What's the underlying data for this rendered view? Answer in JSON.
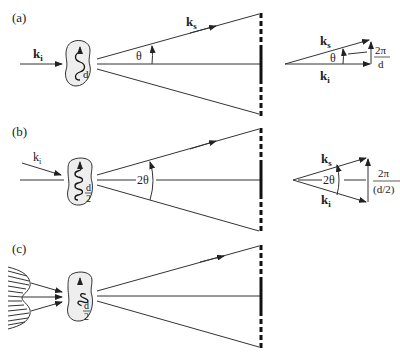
{
  "figure": {
    "panels": [
      {
        "label": "(a)",
        "incident_label": "k",
        "incident_sub": "i",
        "scattered_label": "k",
        "scattered_sub": "s",
        "angle_label": "θ",
        "spacing_label": "d",
        "vector": {
          "ks_label": "k",
          "ks_sub": "s",
          "ki_label": "k",
          "ki_sub": "i",
          "angle_label": "θ",
          "q_num": "2π",
          "q_den": "d"
        }
      },
      {
        "label": "(b)",
        "incident_label": "k",
        "incident_sub": "i",
        "angle_label": "2θ",
        "spacing_num": "d",
        "spacing_den": "2",
        "vector": {
          "ks_label": "k",
          "ks_sub": "s",
          "ki_label": "k",
          "ki_sub": "i",
          "angle_label": "2θ",
          "q_num": "2π",
          "q_den": "(d/2)"
        }
      },
      {
        "label": "(c)",
        "spacing_num": "d",
        "spacing_den": "2"
      }
    ]
  }
}
